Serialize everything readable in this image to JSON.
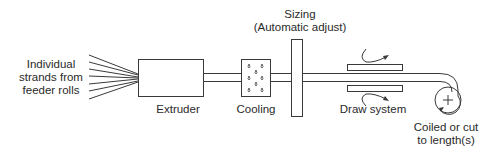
{
  "diagram": {
    "type": "process-flow",
    "stages": [
      {
        "id": "feed",
        "label_lines": [
          "Individual",
          "strands from",
          "feeder rolls"
        ]
      },
      {
        "id": "extruder",
        "label": "Extruder"
      },
      {
        "id": "cooling",
        "label": "Cooling"
      },
      {
        "id": "sizing",
        "label_lines": [
          "Sizing",
          "(Automatic adjust)"
        ]
      },
      {
        "id": "draw",
        "label": "Draw system"
      },
      {
        "id": "coil",
        "label_lines": [
          "Coiled or cut",
          "to length(s)"
        ]
      }
    ],
    "colors": {
      "stroke": "#3a3a3a",
      "text": "#2a2a2a",
      "background": "#ffffff"
    }
  }
}
